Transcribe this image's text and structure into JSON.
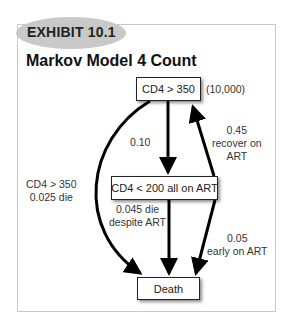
{
  "badge": {
    "label": "EXHIBIT 10.1"
  },
  "title": "Markov Model 4 Count",
  "nodes": {
    "top": {
      "label": "CD4 > 350",
      "count": "(10,000)"
    },
    "middle": {
      "label": "CD4 < 200 all on ART"
    },
    "bottom": {
      "label": "Death"
    }
  },
  "edges": {
    "top_to_middle": {
      "line1": "0.10"
    },
    "top_to_death": {
      "line1": "CD4 > 350",
      "line2": "0.025 die"
    },
    "middle_to_death": {
      "line1": "0.045 die",
      "line2": "despite ART"
    },
    "middle_to_top": {
      "line1": "0.45",
      "line2": "recover on",
      "line3": "ART"
    },
    "early_to_death": {
      "line1": "0.05",
      "line2": "early on ART"
    }
  },
  "colors": {
    "badge": "#c9c9c9",
    "frame": "#c9c9c9",
    "arrow": "#000000"
  }
}
